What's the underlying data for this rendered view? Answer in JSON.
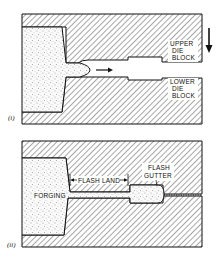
{
  "figure": {
    "panels": [
      {
        "id": "i",
        "label": "(i)",
        "annotations": {
          "upper_die": [
            "UPPER",
            "DIE",
            "BLOCK"
          ],
          "lower_die": [
            "LOWER",
            "DIE",
            "BLOCK"
          ]
        },
        "arrows": [
          "metal-flow-arrow-right",
          "die-motion-arrow-down"
        ]
      },
      {
        "id": "ii",
        "label": "(ii)",
        "annotations": {
          "forging": "FORGING",
          "flash_land": "FLASH LAND",
          "flash_gutter": [
            "FLASH",
            "GUTTER"
          ]
        }
      }
    ],
    "colors": {
      "hatch": "#222222",
      "stipple": "#555555",
      "background": "#ffffff"
    }
  }
}
